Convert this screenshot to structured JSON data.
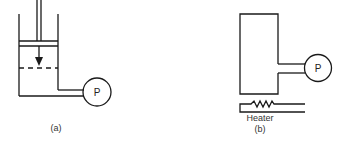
{
  "diagram": {
    "panels": [
      {
        "id": "a",
        "caption": "(a)",
        "description": "Piston-cylinder with pressure gauge",
        "gauge_label": "P"
      },
      {
        "id": "b",
        "caption": "(b)",
        "description": "Rigid container heated from below with pressure gauge",
        "gauge_label": "P",
        "heater_label": "Heater"
      }
    ],
    "colors": {
      "stroke": "#1a1a1a",
      "background": "#ffffff"
    }
  }
}
